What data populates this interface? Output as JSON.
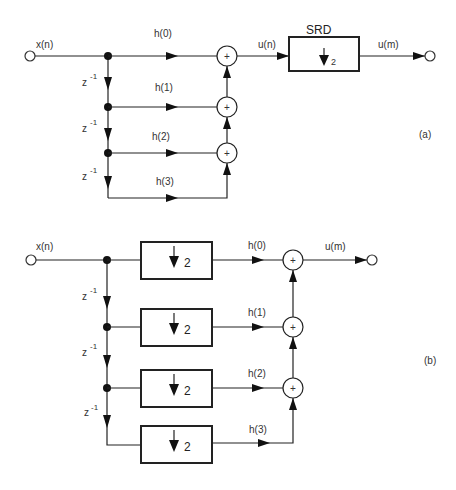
{
  "diagram_a": {
    "panel_label": "(a)",
    "input_label": "x(n)",
    "delay_label": "z",
    "delay_exp": "-1",
    "taps": [
      "h(0)",
      "h(1)",
      "h(2)",
      "h(3)"
    ],
    "adder_symbol": "+",
    "intermediate_label": "u(n)",
    "srd_title": "SRD",
    "srd_factor": "2",
    "output_label": "u(m)"
  },
  "diagram_b": {
    "panel_label": "(b)",
    "input_label": "x(n)",
    "delay_label": "z",
    "delay_exp": "-1",
    "taps": [
      "h(0)",
      "h(1)",
      "h(2)",
      "h(3)"
    ],
    "downsample_factor": "2",
    "adder_symbol": "+",
    "output_label": "u(m)"
  }
}
